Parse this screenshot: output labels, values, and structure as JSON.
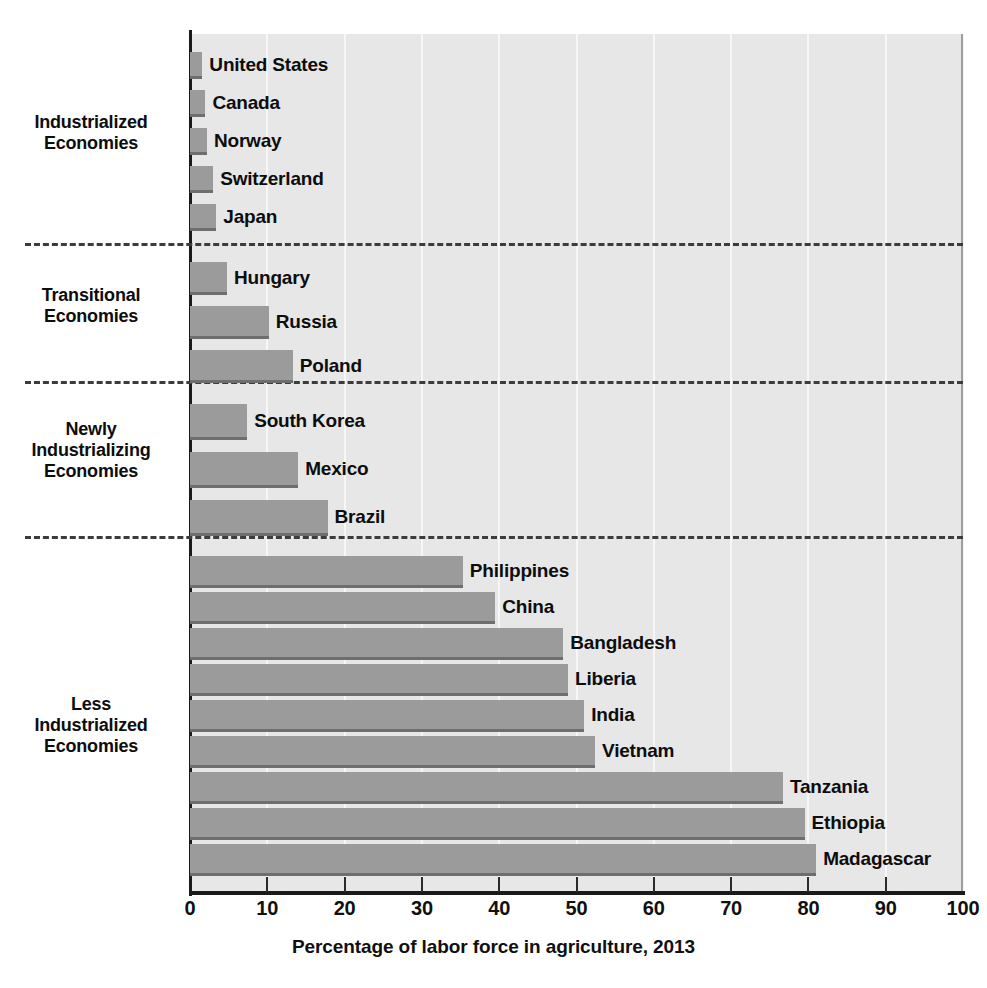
{
  "chart_data": {
    "type": "bar",
    "orientation": "horizontal",
    "title": "",
    "xlabel": "Percentage of labor force in agriculture, 2013",
    "ylabel": "",
    "xlim": [
      0,
      100
    ],
    "xticks": [
      0,
      10,
      20,
      30,
      40,
      50,
      60,
      70,
      80,
      90,
      100
    ],
    "xtick_labels": [
      "0",
      "10",
      "20",
      "30",
      "40",
      "50",
      "60",
      "70",
      "80",
      "90",
      "100"
    ],
    "grid": "vertical-white-gridlines",
    "legend": "none",
    "bar_color": "#9b9b9b",
    "bar_shadow_color": "#6e6e6e",
    "plot_background": "#e8e8e8",
    "categories": [
      "United States",
      "Canada",
      "Norway",
      "Switzerland",
      "Japan",
      "Hungary",
      "Russia",
      "Poland",
      "South Korea",
      "Mexico",
      "Brazil",
      "Philippines",
      "China",
      "Bangladesh",
      "Liberia",
      "India",
      "Vietnam",
      "Tanzania",
      "Ethiopia",
      "Madagascar"
    ],
    "values": [
      1.6,
      2.0,
      2.2,
      3.0,
      3.4,
      4.8,
      10.2,
      13.3,
      7.4,
      14.0,
      17.8,
      35.3,
      39.5,
      48.3,
      48.9,
      51.0,
      52.4,
      76.7,
      79.5,
      81.0
    ],
    "groups": [
      {
        "label": "Industrialized\nEconomies",
        "label_line1": "Industrialized",
        "label_line2": "Economies",
        "items": [
          {
            "name": "United States",
            "value": 1.6
          },
          {
            "name": "Canada",
            "value": 2.0
          },
          {
            "name": "Norway",
            "value": 2.2
          },
          {
            "name": "Switzerland",
            "value": 3.0
          },
          {
            "name": "Japan",
            "value": 3.4
          }
        ]
      },
      {
        "label": "Transitional\nEconomies",
        "label_line1": "Transitional",
        "label_line2": "Economies",
        "items": [
          {
            "name": "Hungary",
            "value": 4.8
          },
          {
            "name": "Russia",
            "value": 10.2
          },
          {
            "name": "Poland",
            "value": 13.3
          }
        ]
      },
      {
        "label": "Newly\nIndustrializing\nEconomies",
        "label_line1": "Newly",
        "label_line2": "Industrializing",
        "label_line3": "Economies",
        "items": [
          {
            "name": "South Korea",
            "value": 7.4
          },
          {
            "name": "Mexico",
            "value": 14.0
          },
          {
            "name": "Brazil",
            "value": 17.8
          }
        ]
      },
      {
        "label": "Less\nIndustrialized\nEconomies",
        "label_line1": "Less",
        "label_line2": "Industrialized",
        "label_line3": "Economies",
        "items": [
          {
            "name": "Philippines",
            "value": 35.3
          },
          {
            "name": "China",
            "value": 39.5
          },
          {
            "name": "Bangladesh",
            "value": 48.3
          },
          {
            "name": "Liberia",
            "value": 48.9
          },
          {
            "name": "India",
            "value": 51.0
          },
          {
            "name": "Vietnam",
            "value": 52.4
          },
          {
            "name": "Tanzania",
            "value": 76.7
          },
          {
            "name": "Ethiopia",
            "value": 79.5
          },
          {
            "name": "Madagascar",
            "value": 81.0
          }
        ]
      }
    ]
  },
  "axis": {
    "x_title": "Percentage of labor force in agriculture, 2013",
    "ticks": [
      "0",
      "10",
      "20",
      "30",
      "40",
      "50",
      "60",
      "70",
      "80",
      "90",
      "100"
    ]
  },
  "group_labels": {
    "industrialized": {
      "line1": "Industrialized",
      "line2": "Economies"
    },
    "transitional": {
      "line1": "Transitional",
      "line2": "Economies"
    },
    "newly_industrializing": {
      "line1": "Newly",
      "line2": "Industrializing",
      "line3": "Economies"
    },
    "less_industrialized": {
      "line1": "Less",
      "line2": "Industrialized",
      "line3": "Economies"
    }
  },
  "bars": {
    "united_states": "United States",
    "canada": "Canada",
    "norway": "Norway",
    "switzerland": "Switzerland",
    "japan": "Japan",
    "hungary": "Hungary",
    "russia": "Russia",
    "poland": "Poland",
    "south_korea": "South Korea",
    "mexico": "Mexico",
    "brazil": "Brazil",
    "philippines": "Philippines",
    "china": "China",
    "bangladesh": "Bangladesh",
    "liberia": "Liberia",
    "india": "India",
    "vietnam": "Vietnam",
    "tanzania": "Tanzania",
    "ethiopia": "Ethiopia",
    "madagascar": "Madagascar"
  }
}
